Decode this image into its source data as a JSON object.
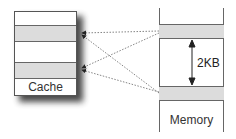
{
  "cache": {
    "label": "Cache",
    "rows": [
      {
        "fill": "#ffffff",
        "top": 0,
        "height": 14
      },
      {
        "fill": "#dcdcdc",
        "top": 14,
        "height": 16
      },
      {
        "fill": "#ffffff",
        "top": 30,
        "height": 21
      },
      {
        "fill": "#dcdcdc",
        "top": 51,
        "height": 16
      },
      {
        "fill": "#ffffff",
        "top": 67,
        "height": 18
      }
    ]
  },
  "memory": {
    "label": "Memory",
    "bands": [
      {
        "top": 24,
        "fill": "#dcdcdc"
      },
      {
        "top": 86,
        "fill": "#dcdcdc"
      }
    ],
    "gap_label": "2KB"
  },
  "colors": {
    "band_fill": "#dcdcdc",
    "line": "#666666",
    "shadow": "#2a2a2a"
  }
}
